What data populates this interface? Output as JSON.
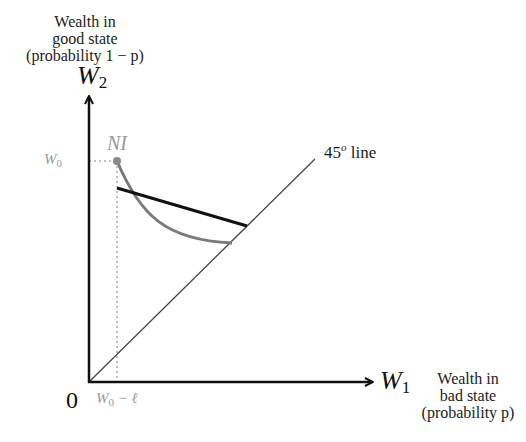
{
  "diagram": {
    "y_axis": {
      "symbol": "W",
      "subscript": "2",
      "description_lines": [
        "Wealth in",
        "good state",
        "(probability 1 − p)"
      ]
    },
    "x_axis": {
      "symbol": "W",
      "subscript": "1",
      "description_lines": [
        "Wealth in",
        "bad state",
        "(probability p)"
      ]
    },
    "origin_label": "0",
    "y_tick": {
      "symbol": "W",
      "subscript": "0"
    },
    "x_tick": {
      "symbol": "W",
      "subscript": "0",
      "suffix": " − ℓ"
    },
    "point_label": "NI",
    "line_45_label": {
      "number": "45",
      "superscript": "o",
      "text": " line"
    },
    "colors": {
      "axes": "#111111",
      "indifference_curve": "#7a7a7a",
      "budget_line": "#111111",
      "guide_lines": "#aaaaaa",
      "diagonal": "#444444",
      "annotation": "#9a9a9a"
    }
  }
}
